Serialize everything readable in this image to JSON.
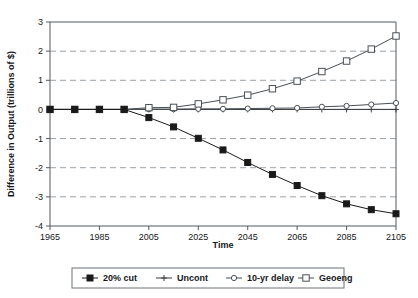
{
  "chart_data": {
    "type": "line",
    "title": "",
    "xlabel": "Time",
    "ylabel": "Difference in Output (trillions of $)",
    "xlim": [
      1965,
      2105
    ],
    "ylim": [
      -4,
      3
    ],
    "xticks": [
      1965,
      1985,
      2005,
      2025,
      2045,
      2065,
      2085,
      2105
    ],
    "xtick_labels": [
      "1965",
      "1985",
      "2005",
      "2025",
      "2045",
      "2065",
      "2085",
      "2105"
    ],
    "yticks": [
      3,
      2,
      1,
      0,
      -1,
      -2,
      -3,
      -4
    ],
    "ytick_labels": [
      "3",
      "2",
      "1",
      "0",
      "-1",
      "-2",
      "-3",
      "-4"
    ],
    "grid": "horizontal-dashed",
    "legend_position": "bottom",
    "x": [
      1965,
      1975,
      1985,
      1995,
      2005,
      2015,
      2025,
      2035,
      2045,
      2055,
      2065,
      2075,
      2085,
      2095,
      2105
    ],
    "series": [
      {
        "name": "20% cut",
        "marker": "filled-square",
        "color": "#1a1a1a",
        "values": [
          0,
          0,
          0,
          0,
          -0.28,
          -0.6,
          -0.99,
          -1.39,
          -1.82,
          -2.23,
          -2.61,
          -2.96,
          -3.24,
          -3.44,
          -3.58
        ]
      },
      {
        "name": "Uncont",
        "marker": "plus",
        "color": "#3a3f44",
        "values": [
          0,
          0,
          0,
          0,
          0,
          0,
          0,
          0,
          0,
          0,
          0,
          0,
          0,
          0,
          0
        ]
      },
      {
        "name": "10-yr delay",
        "marker": "open-circle",
        "color": "#4a5055",
        "values": [
          0,
          0,
          0,
          0,
          0.01,
          0.01,
          0.02,
          0.02,
          0.03,
          0.04,
          0.05,
          0.09,
          0.12,
          0.17,
          0.22
        ]
      },
      {
        "name": "Geoeng",
        "marker": "open-square",
        "color": "#4a5055",
        "values": [
          0,
          0,
          0,
          0,
          0.06,
          0.07,
          0.19,
          0.33,
          0.49,
          0.71,
          0.97,
          1.3,
          1.66,
          2.07,
          2.52
        ]
      }
    ]
  },
  "legend": {
    "items": [
      {
        "label": "20% cut"
      },
      {
        "label": "Uncont"
      },
      {
        "label": "10-yr delay"
      },
      {
        "label": "Geoeng"
      }
    ]
  }
}
